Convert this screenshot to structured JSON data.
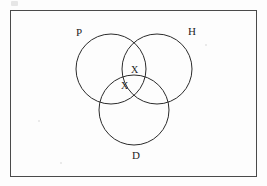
{
  "diagram": {
    "type": "venn-3-set",
    "title": "",
    "background_color": "#fdfdfd",
    "frame": {
      "name": "outer-border",
      "color": "#4a4a4a",
      "x": 10,
      "y": 10,
      "width": 247,
      "height": 167
    },
    "stroke_color": "#2b2b2b",
    "sets": [
      {
        "id": "P",
        "label": "P",
        "label_x": 76,
        "label_y": 27,
        "circle": {
          "cx": 111,
          "cy": 69,
          "r": 35
        }
      },
      {
        "id": "H",
        "label": "H",
        "label_x": 188,
        "label_y": 26,
        "circle": {
          "cx": 157,
          "cy": 69,
          "r": 35
        }
      },
      {
        "id": "D",
        "label": "D",
        "label_x": 132,
        "label_y": 150,
        "circle": {
          "cx": 134,
          "cy": 110,
          "r": 35
        }
      }
    ],
    "marks": [
      {
        "label": "X",
        "region": "P-and-H",
        "x": 131,
        "y": 65
      },
      {
        "label": "X",
        "region": "P-and-D",
        "x": 121,
        "y": 81
      }
    ]
  }
}
